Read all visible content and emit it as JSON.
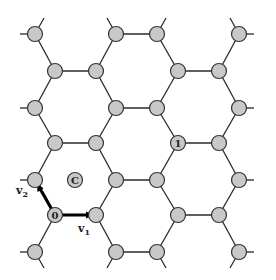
{
  "diagram": {
    "type": "honeycomb-lattice",
    "node_color": "#c8c8c8",
    "edge_color": "#2a2a2a",
    "labels": {
      "origin": "0",
      "site_one": "1",
      "center": "C",
      "v1": "v",
      "v1_sub": "1",
      "v2": "v",
      "v2_sub": "2"
    }
  }
}
